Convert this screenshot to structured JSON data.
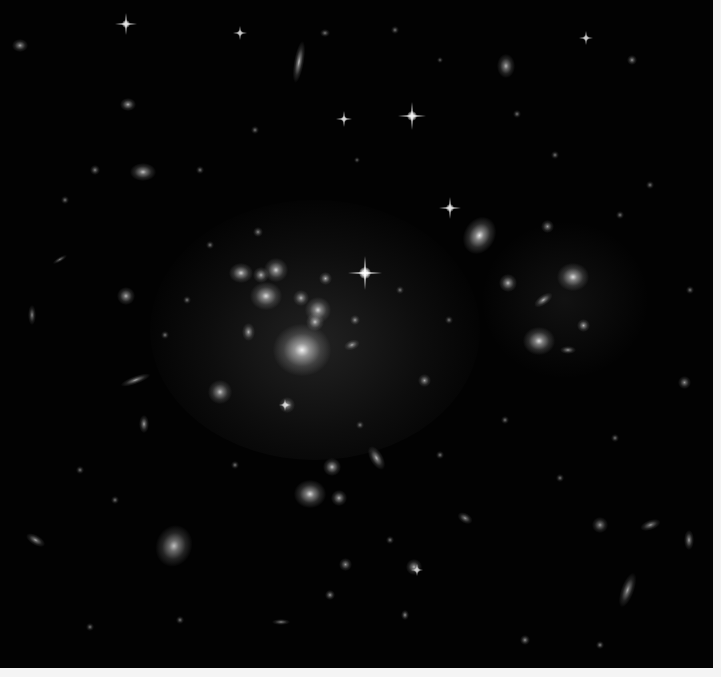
{
  "image": {
    "subject": "galaxy cluster deep field",
    "background_color": "#020202",
    "border_color": "#f4f4f4"
  },
  "galaxies": [
    {
      "x": 302,
      "y": 350,
      "rx": 22,
      "ry": 20,
      "rot": 0,
      "b": 0.95
    },
    {
      "x": 266,
      "y": 296,
      "rx": 12,
      "ry": 11,
      "rot": 0,
      "b": 0.85
    },
    {
      "x": 276,
      "y": 270,
      "rx": 9,
      "ry": 9,
      "rot": 0,
      "b": 0.8
    },
    {
      "x": 241,
      "y": 273,
      "rx": 9,
      "ry": 8,
      "rot": 0,
      "b": 0.8
    },
    {
      "x": 318,
      "y": 310,
      "rx": 10,
      "ry": 10,
      "rot": 0,
      "b": 0.8
    },
    {
      "x": 315,
      "y": 322,
      "rx": 7,
      "ry": 7,
      "rot": 0,
      "b": 0.75
    },
    {
      "x": 301,
      "y": 298,
      "rx": 6,
      "ry": 6,
      "rot": 0,
      "b": 0.7
    },
    {
      "x": 261,
      "y": 275,
      "rx": 6,
      "ry": 6,
      "rot": 0,
      "b": 0.7
    },
    {
      "x": 325,
      "y": 278,
      "rx": 5,
      "ry": 5,
      "rot": 0,
      "b": 0.7
    },
    {
      "x": 248,
      "y": 332,
      "rx": 5,
      "ry": 7,
      "rot": 0,
      "b": 0.7
    },
    {
      "x": 352,
      "y": 345,
      "rx": 6,
      "ry": 4,
      "rot": -20,
      "b": 0.65
    },
    {
      "x": 355,
      "y": 320,
      "rx": 4,
      "ry": 4,
      "rot": 0,
      "b": 0.6
    },
    {
      "x": 480,
      "y": 235,
      "rx": 12,
      "ry": 15,
      "rot": 30,
      "b": 0.9
    },
    {
      "x": 573,
      "y": 277,
      "rx": 12,
      "ry": 11,
      "rot": 0,
      "b": 0.85
    },
    {
      "x": 539,
      "y": 341,
      "rx": 12,
      "ry": 11,
      "rot": 0,
      "b": 0.85
    },
    {
      "x": 508,
      "y": 283,
      "rx": 7,
      "ry": 7,
      "rot": 0,
      "b": 0.75
    },
    {
      "x": 543,
      "y": 300,
      "rx": 8,
      "ry": 4,
      "rot": -35,
      "b": 0.7
    },
    {
      "x": 583,
      "y": 325,
      "rx": 5,
      "ry": 5,
      "rot": 0,
      "b": 0.7
    },
    {
      "x": 568,
      "y": 350,
      "rx": 6,
      "ry": 3,
      "rot": 0,
      "b": 0.6
    },
    {
      "x": 310,
      "y": 494,
      "rx": 12,
      "ry": 11,
      "rot": 0,
      "b": 0.85
    },
    {
      "x": 332,
      "y": 467,
      "rx": 7,
      "ry": 7,
      "rot": 0,
      "b": 0.75
    },
    {
      "x": 339,
      "y": 498,
      "rx": 6,
      "ry": 6,
      "rot": 0,
      "b": 0.7
    },
    {
      "x": 376,
      "y": 458,
      "rx": 5,
      "ry": 10,
      "rot": -30,
      "b": 0.7
    },
    {
      "x": 174,
      "y": 546,
      "rx": 14,
      "ry": 16,
      "rot": 20,
      "b": 0.75
    },
    {
      "x": 220,
      "y": 392,
      "rx": 9,
      "ry": 9,
      "rot": 0,
      "b": 0.75
    },
    {
      "x": 287,
      "y": 405,
      "rx": 6,
      "ry": 6,
      "rot": 0,
      "b": 0.7
    },
    {
      "x": 126,
      "y": 296,
      "rx": 7,
      "ry": 7,
      "rot": 0,
      "b": 0.7
    },
    {
      "x": 143,
      "y": 172,
      "rx": 10,
      "ry": 7,
      "rot": 0,
      "b": 0.75
    },
    {
      "x": 299,
      "y": 62,
      "rx": 4,
      "ry": 16,
      "rot": 10,
      "b": 0.75
    },
    {
      "x": 506,
      "y": 66,
      "rx": 7,
      "ry": 9,
      "rot": 0,
      "b": 0.7
    },
    {
      "x": 128,
      "y": 104,
      "rx": 6,
      "ry": 5,
      "rot": 0,
      "b": 0.7
    },
    {
      "x": 20,
      "y": 45,
      "rx": 6,
      "ry": 5,
      "rot": 0,
      "b": 0.65
    },
    {
      "x": 136,
      "y": 380,
      "rx": 12,
      "ry": 3,
      "rot": -20,
      "b": 0.65
    },
    {
      "x": 144,
      "y": 424,
      "rx": 4,
      "ry": 7,
      "rot": 0,
      "b": 0.65
    },
    {
      "x": 35,
      "y": 540,
      "rx": 8,
      "ry": 4,
      "rot": 30,
      "b": 0.65
    },
    {
      "x": 465,
      "y": 518,
      "rx": 6,
      "ry": 4,
      "rot": 30,
      "b": 0.6
    },
    {
      "x": 414,
      "y": 567,
      "rx": 6,
      "ry": 6,
      "rot": 0,
      "b": 0.7
    },
    {
      "x": 627,
      "y": 590,
      "rx": 5,
      "ry": 14,
      "rot": 20,
      "b": 0.65
    },
    {
      "x": 689,
      "y": 540,
      "rx": 4,
      "ry": 8,
      "rot": 0,
      "b": 0.65
    },
    {
      "x": 600,
      "y": 525,
      "rx": 6,
      "ry": 6,
      "rot": 0,
      "b": 0.6
    },
    {
      "x": 650,
      "y": 525,
      "rx": 8,
      "ry": 4,
      "rot": -20,
      "b": 0.6
    },
    {
      "x": 424,
      "y": 380,
      "rx": 5,
      "ry": 5,
      "rot": 0,
      "b": 0.65
    },
    {
      "x": 684,
      "y": 382,
      "rx": 5,
      "ry": 5,
      "rot": 0,
      "b": 0.6
    },
    {
      "x": 632,
      "y": 60,
      "rx": 4,
      "ry": 4,
      "rot": 0,
      "b": 0.6
    },
    {
      "x": 547,
      "y": 226,
      "rx": 5,
      "ry": 5,
      "rot": 0,
      "b": 0.6
    },
    {
      "x": 345,
      "y": 564,
      "rx": 5,
      "ry": 5,
      "rot": 0,
      "b": 0.6
    },
    {
      "x": 330,
      "y": 595,
      "rx": 4,
      "ry": 4,
      "rot": 0,
      "b": 0.6
    },
    {
      "x": 281,
      "y": 622,
      "rx": 7,
      "ry": 2,
      "rot": 0,
      "b": 0.55
    },
    {
      "x": 405,
      "y": 615,
      "rx": 3,
      "ry": 4,
      "rot": 0,
      "b": 0.6
    },
    {
      "x": 525,
      "y": 640,
      "rx": 4,
      "ry": 4,
      "rot": 0,
      "b": 0.6
    },
    {
      "x": 600,
      "y": 645,
      "rx": 3,
      "ry": 3,
      "rot": 0,
      "b": 0.55
    },
    {
      "x": 60,
      "y": 260,
      "rx": 6,
      "ry": 2,
      "rot": -30,
      "b": 0.5
    },
    {
      "x": 32,
      "y": 315,
      "rx": 3,
      "ry": 8,
      "rot": 0,
      "b": 0.55
    },
    {
      "x": 95,
      "y": 170,
      "rx": 4,
      "ry": 4,
      "rot": 0,
      "b": 0.55
    },
    {
      "x": 65,
      "y": 200,
      "rx": 3,
      "ry": 3,
      "rot": 0,
      "b": 0.5
    },
    {
      "x": 200,
      "y": 170,
      "rx": 3,
      "ry": 3,
      "rot": 0,
      "b": 0.5
    },
    {
      "x": 258,
      "y": 232,
      "rx": 4,
      "ry": 4,
      "rot": 0,
      "b": 0.55
    },
    {
      "x": 187,
      "y": 300,
      "rx": 3,
      "ry": 3,
      "rot": 0,
      "b": 0.5
    },
    {
      "x": 400,
      "y": 290,
      "rx": 3,
      "ry": 3,
      "rot": 0,
      "b": 0.5
    },
    {
      "x": 449,
      "y": 320,
      "rx": 3,
      "ry": 3,
      "rot": 0,
      "b": 0.5
    },
    {
      "x": 620,
      "y": 215,
      "rx": 3,
      "ry": 3,
      "rot": 0,
      "b": 0.5
    },
    {
      "x": 650,
      "y": 185,
      "rx": 3,
      "ry": 3,
      "rot": 0,
      "b": 0.5
    },
    {
      "x": 555,
      "y": 155,
      "rx": 3,
      "ry": 3,
      "rot": 0,
      "b": 0.5
    },
    {
      "x": 690,
      "y": 290,
      "rx": 3,
      "ry": 3,
      "rot": 0,
      "b": 0.5
    },
    {
      "x": 615,
      "y": 438,
      "rx": 3,
      "ry": 3,
      "rot": 0,
      "b": 0.5
    },
    {
      "x": 560,
      "y": 478,
      "rx": 3,
      "ry": 3,
      "rot": 0,
      "b": 0.5
    },
    {
      "x": 505,
      "y": 420,
      "rx": 3,
      "ry": 3,
      "rot": 0,
      "b": 0.5
    },
    {
      "x": 80,
      "y": 470,
      "rx": 3,
      "ry": 3,
      "rot": 0,
      "b": 0.5
    },
    {
      "x": 115,
      "y": 500,
      "rx": 3,
      "ry": 3,
      "rot": 0,
      "b": 0.5
    },
    {
      "x": 180,
      "y": 620,
      "rx": 3,
      "ry": 3,
      "rot": 0,
      "b": 0.5
    },
    {
      "x": 90,
      "y": 627,
      "rx": 3,
      "ry": 3,
      "rot": 0,
      "b": 0.5
    },
    {
      "x": 235,
      "y": 465,
      "rx": 3,
      "ry": 3,
      "rot": 0,
      "b": 0.5
    },
    {
      "x": 390,
      "y": 540,
      "rx": 3,
      "ry": 3,
      "rot": 0,
      "b": 0.5
    },
    {
      "x": 360,
      "y": 425,
      "rx": 3,
      "ry": 3,
      "rot": 0,
      "b": 0.5
    },
    {
      "x": 440,
      "y": 455,
      "rx": 3,
      "ry": 3,
      "rot": 0,
      "b": 0.5
    },
    {
      "x": 165,
      "y": 335,
      "rx": 3,
      "ry": 3,
      "rot": 0,
      "b": 0.5
    },
    {
      "x": 210,
      "y": 245,
      "rx": 3,
      "ry": 3,
      "rot": 0,
      "b": 0.5
    },
    {
      "x": 395,
      "y": 30,
      "rx": 3,
      "ry": 3,
      "rot": 0,
      "b": 0.5
    },
    {
      "x": 325,
      "y": 33,
      "rx": 4,
      "ry": 3,
      "rot": 0,
      "b": 0.5
    },
    {
      "x": 440,
      "y": 60,
      "rx": 2,
      "ry": 2,
      "rot": 0,
      "b": 0.45
    },
    {
      "x": 255,
      "y": 130,
      "rx": 3,
      "ry": 3,
      "rot": 0,
      "b": 0.5
    },
    {
      "x": 357,
      "y": 160,
      "rx": 2,
      "ry": 2,
      "rot": 0,
      "b": 0.45
    },
    {
      "x": 517,
      "y": 114,
      "rx": 3,
      "ry": 3,
      "rot": 0,
      "b": 0.5
    }
  ],
  "stars": [
    {
      "x": 365,
      "y": 273,
      "size": 34,
      "b": 1.0
    },
    {
      "x": 412,
      "y": 116,
      "size": 28,
      "b": 0.95
    },
    {
      "x": 450,
      "y": 208,
      "size": 22,
      "b": 0.9
    },
    {
      "x": 126,
      "y": 24,
      "size": 22,
      "b": 0.9
    },
    {
      "x": 344,
      "y": 119,
      "size": 16,
      "b": 0.85
    },
    {
      "x": 240,
      "y": 33,
      "size": 14,
      "b": 0.8
    },
    {
      "x": 586,
      "y": 38,
      "size": 14,
      "b": 0.8
    },
    {
      "x": 285,
      "y": 405,
      "size": 12,
      "b": 0.75
    },
    {
      "x": 417,
      "y": 570,
      "size": 12,
      "b": 0.75
    }
  ]
}
